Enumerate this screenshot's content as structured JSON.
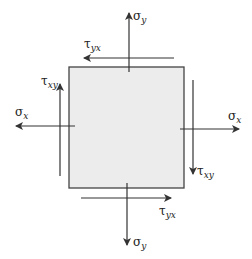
{
  "diagram": {
    "element": {
      "fill": "#ececec",
      "stroke": "#444444"
    },
    "arrow_color": "#333333",
    "labels": {
      "sigma_y_top": {
        "symbol": "σ",
        "subscript": "y"
      },
      "sigma_y_bottom": {
        "symbol": "σ",
        "subscript": "y"
      },
      "sigma_x_left": {
        "symbol": "σ",
        "subscript": "x"
      },
      "sigma_x_right": {
        "symbol": "σ",
        "subscript": "x"
      },
      "tau_yx_top": {
        "symbol": "τ",
        "subscript": "yx"
      },
      "tau_yx_bottom": {
        "symbol": "τ",
        "subscript": "yx"
      },
      "tau_xy_left": {
        "symbol": "τ",
        "subscript": "xy"
      },
      "tau_xy_right": {
        "symbol": "τ",
        "subscript": "xy"
      }
    }
  }
}
